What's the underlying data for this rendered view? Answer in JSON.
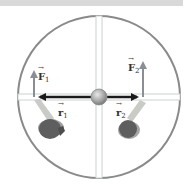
{
  "diagram": {
    "type": "top-view-rotating-platform",
    "colors": {
      "rim": "#8a8a8a",
      "spokes": "#d2d6d6",
      "hub": "#a9a9a9",
      "position_vector": "#1a1a1a",
      "force_vector": "#8a8f96",
      "person_body": "#5e5e5e",
      "person_arm": "#c9cbc6"
    },
    "labels": {
      "F1": {
        "base": "F",
        "sub": "1"
      },
      "F2": {
        "base": "F",
        "sub": "2"
      },
      "r1": {
        "base": "r",
        "sub": "1"
      },
      "r2": {
        "base": "r",
        "sub": "2"
      }
    },
    "vectors": [
      {
        "name": "r1",
        "kind": "position",
        "direction": "left",
        "from": "hub"
      },
      {
        "name": "r2",
        "kind": "position",
        "direction": "right",
        "from": "hub"
      },
      {
        "name": "F1",
        "kind": "force",
        "direction": "up",
        "at": "end of r1"
      },
      {
        "name": "F2",
        "kind": "force",
        "direction": "up",
        "at": "end of r2"
      }
    ],
    "people": [
      {
        "position": "lower-left",
        "pushing_at": "end of r1"
      },
      {
        "position": "lower-right",
        "pushing_at": "end of r2"
      }
    ]
  }
}
